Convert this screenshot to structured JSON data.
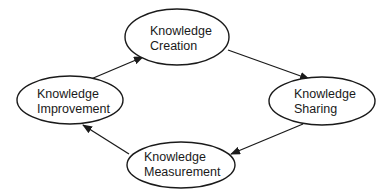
{
  "diagram": {
    "type": "cycle",
    "nodes": [
      {
        "id": "creation",
        "line1": "Knowledge",
        "line2": "Creation"
      },
      {
        "id": "sharing",
        "line1": "Knowledge",
        "line2": "Sharing"
      },
      {
        "id": "measurement",
        "line1": "Knowledge",
        "line2": "Measurement"
      },
      {
        "id": "improvement",
        "line1": "Knowledge",
        "line2": "Improvement"
      }
    ],
    "edges": [
      {
        "from": "improvement",
        "to": "creation"
      },
      {
        "from": "creation",
        "to": "sharing"
      },
      {
        "from": "sharing",
        "to": "measurement"
      },
      {
        "from": "measurement",
        "to": "improvement"
      }
    ],
    "colors": {
      "stroke": "#1a1a1a",
      "fill": "#ffffff",
      "background": "#ffffff"
    }
  }
}
